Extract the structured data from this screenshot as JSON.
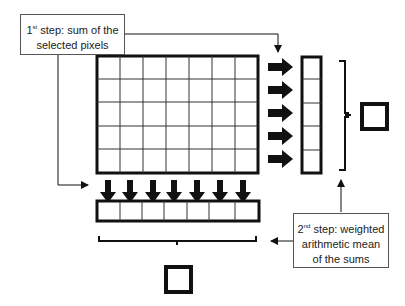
{
  "step1": {
    "num": "1",
    "sup": "st",
    "line1_rest": " step: sum of the",
    "line2": "selected pixels"
  },
  "step2": {
    "num": "2",
    "sup": "nd",
    "line1_rest": " step: weighted",
    "line2": "arithmetic mean",
    "line3": "of the sums"
  },
  "grid": {
    "columns": 7,
    "rows": 5
  },
  "colors": {
    "stroke": "#111111",
    "thin": "#444444"
  }
}
